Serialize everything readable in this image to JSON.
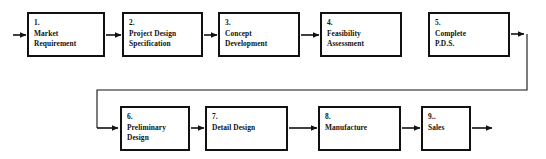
{
  "diagram": {
    "background_color": "#ffffff",
    "line_color": "#111111",
    "text_color": "#111111",
    "nodes": [
      {
        "id": "1",
        "number": "1.",
        "lines": [
          "Market",
          "Requirement"
        ]
      },
      {
        "id": "2",
        "number": "2.",
        "lines": [
          "Project Design",
          "Specification"
        ]
      },
      {
        "id": "3",
        "number": "3.",
        "lines": [
          "Concept",
          "Development"
        ]
      },
      {
        "id": "4",
        "number": "4.",
        "lines": [
          "Feasibility",
          "Assessment"
        ]
      },
      {
        "id": "5",
        "number": "5.",
        "lines": [
          "Complete",
          "P.D.S."
        ]
      },
      {
        "id": "6",
        "number": "6.",
        "lines": [
          "Preliminary",
          "Design"
        ]
      },
      {
        "id": "7",
        "number": "7.",
        "lines": [
          "Detail Design",
          ""
        ]
      },
      {
        "id": "8",
        "number": "8.",
        "lines": [
          "Manufacture",
          ""
        ]
      },
      {
        "id": "9",
        "number": "9..",
        "lines": [
          "Sales",
          ""
        ]
      }
    ],
    "connectors": [
      {
        "name": "entry-arrow-into-1",
        "from": "start",
        "to": "1"
      },
      {
        "name": "arrow-1-to-2",
        "from": "1",
        "to": "2"
      },
      {
        "name": "arrow-2-to-3",
        "from": "2",
        "to": "3"
      },
      {
        "name": "arrow-3-to-4",
        "from": "3",
        "to": "4"
      },
      {
        "name": "arrow-5-to-6",
        "from": "5",
        "to": "6"
      },
      {
        "name": "arrow-6-to-7",
        "from": "6",
        "to": "7"
      },
      {
        "name": "arrow-7-to-8",
        "from": "7",
        "to": "8"
      },
      {
        "name": "arrow-8-to-9",
        "from": "8",
        "to": "9"
      },
      {
        "name": "exit-arrow-from-9",
        "from": "9",
        "to": "end"
      }
    ]
  }
}
